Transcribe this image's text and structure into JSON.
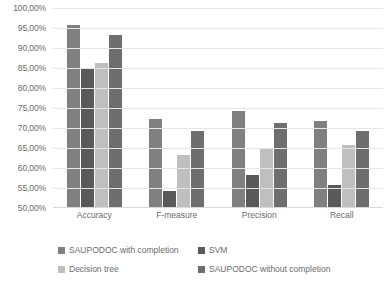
{
  "chart_data": {
    "type": "bar",
    "title": "",
    "xlabel": "",
    "ylabel": "",
    "ylim": [
      50,
      100
    ],
    "ytick_format": "percent-comma",
    "grid": true,
    "legend_position": "bottom",
    "categories": [
      "Accuracy",
      "F-measure",
      "Precision",
      "Recall"
    ],
    "ytick_labels": [
      "50,00%",
      "55,00%",
      "60,00%",
      "65,00%",
      "70,00%",
      "75,00%",
      "80,00%",
      "85,00%",
      "90,00%",
      "95,00%",
      "100,00%"
    ],
    "ytick_values": [
      50,
      55,
      60,
      65,
      70,
      75,
      80,
      85,
      90,
      95,
      100
    ],
    "series": [
      {
        "name": "SAUPODOC with completion",
        "color": "#808080",
        "values": [
          95.5,
          72.0,
          74.0,
          71.5
        ]
      },
      {
        "name": "SVM",
        "color": "#595959",
        "values": [
          84.5,
          54.0,
          58.0,
          55.5
        ]
      },
      {
        "name": "Decision tree",
        "color": "#bfbfbf",
        "values": [
          86.0,
          63.0,
          64.5,
          65.5
        ]
      },
      {
        "name": "SAUPODOC without completion",
        "color": "#6e6e6e",
        "values": [
          93.0,
          69.0,
          71.0,
          69.0
        ]
      }
    ]
  },
  "colors": {
    "background": "#ffffff",
    "gridline": "#e6e6e6",
    "axis_text": "#6b6b6b"
  }
}
